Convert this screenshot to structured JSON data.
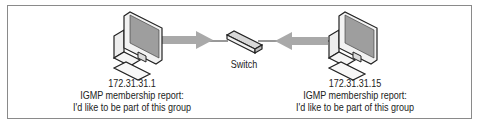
{
  "diagram": {
    "switch": {
      "label": "Switch"
    },
    "hosts": [
      {
        "ip": "172.31.31.1",
        "message_title": "IGMP membership report:",
        "message_body": "I'd like to be part of this group",
        "arrow_direction": "toward-switch-right"
      },
      {
        "ip": "172.31.31.15",
        "message_title": "IGMP membership report:",
        "message_body": "I'd like to be part of this group",
        "arrow_direction": "toward-switch-left"
      }
    ],
    "colors": {
      "arrow": "#a9a9a9",
      "line": "#333333",
      "screen": "#9e9e9e",
      "device_fill": "#f2f2f2",
      "outline": "#222222",
      "frame": "#8a8a8a"
    }
  }
}
